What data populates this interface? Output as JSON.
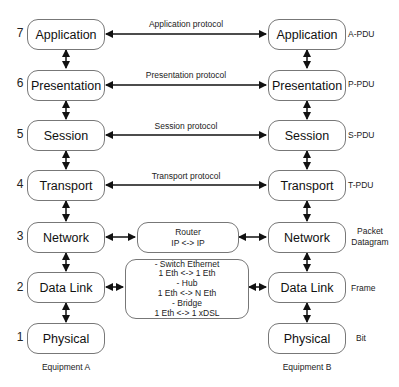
{
  "layers": [
    {
      "num": "7",
      "name": "Application",
      "pdu": "A-PDU",
      "protocol": "Application protocol"
    },
    {
      "num": "6",
      "name": "Presentation",
      "pdu": "P-PDU",
      "protocol": "Presentation protocol"
    },
    {
      "num": "5",
      "name": "Session",
      "pdu": "S-PDU",
      "protocol": "Session protocol"
    },
    {
      "num": "4",
      "name": "Transport",
      "pdu": "T-PDU",
      "protocol": "Transport protocol"
    },
    {
      "num": "3",
      "name": "Network",
      "pdu": "Packet\nDatagram"
    },
    {
      "num": "2",
      "name": "Data Link",
      "pdu": "Frame"
    },
    {
      "num": "1",
      "name": "Physical",
      "pdu": "Bit"
    }
  ],
  "network_pdu_lines": [
    "Packet",
    "Datagram"
  ],
  "router": {
    "lines": [
      "Router",
      "IP <-> IP"
    ]
  },
  "switch": {
    "lines": [
      "- Switch Ethernet",
      "1 Eth <-> 1 Eth",
      "- Hub",
      "1 Eth <-> N Eth",
      "- Bridge",
      "1 Eth <-> 1 xDSL"
    ]
  },
  "equipment": {
    "a": "Equipment A",
    "b": "Equipment B"
  },
  "colors": {
    "border": "#777777",
    "arrow": "#111111",
    "text": "#111111"
  }
}
